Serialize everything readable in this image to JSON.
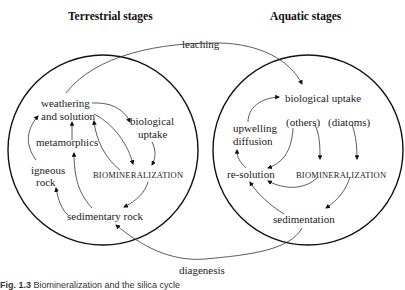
{
  "headers": {
    "terrestrial": "Terrestrial stages",
    "aquatic": "Aquatic stages"
  },
  "flows": {
    "leaching": "leaching",
    "diagenesis": "diagenesis"
  },
  "terrestrial_nodes": {
    "weathering_line1": "weathering",
    "weathering_line2": "and solution",
    "biological_uptake_line1": "biological",
    "biological_uptake_line2": "uptake",
    "metamorphics": "metamorphics",
    "igneous_line1": "igneous",
    "igneous_line2": "rock",
    "biomineralization": "BIOMINERALIZATION",
    "sedimentary_rock": "sedimentary rock"
  },
  "aquatic_nodes": {
    "biological_uptake": "biological uptake",
    "upwelling_line1": "upwelling",
    "upwelling_line2": "diffusion",
    "others": "(others)",
    "diatoms": "(diatoms)",
    "re_solution": "re-solution",
    "biomineralization": "BIOMINERALIZATION",
    "sedimentation": "sedimentation"
  },
  "caption": {
    "label": "Fig. 1.3",
    "text": "Biomineralization and the silica cycle"
  }
}
